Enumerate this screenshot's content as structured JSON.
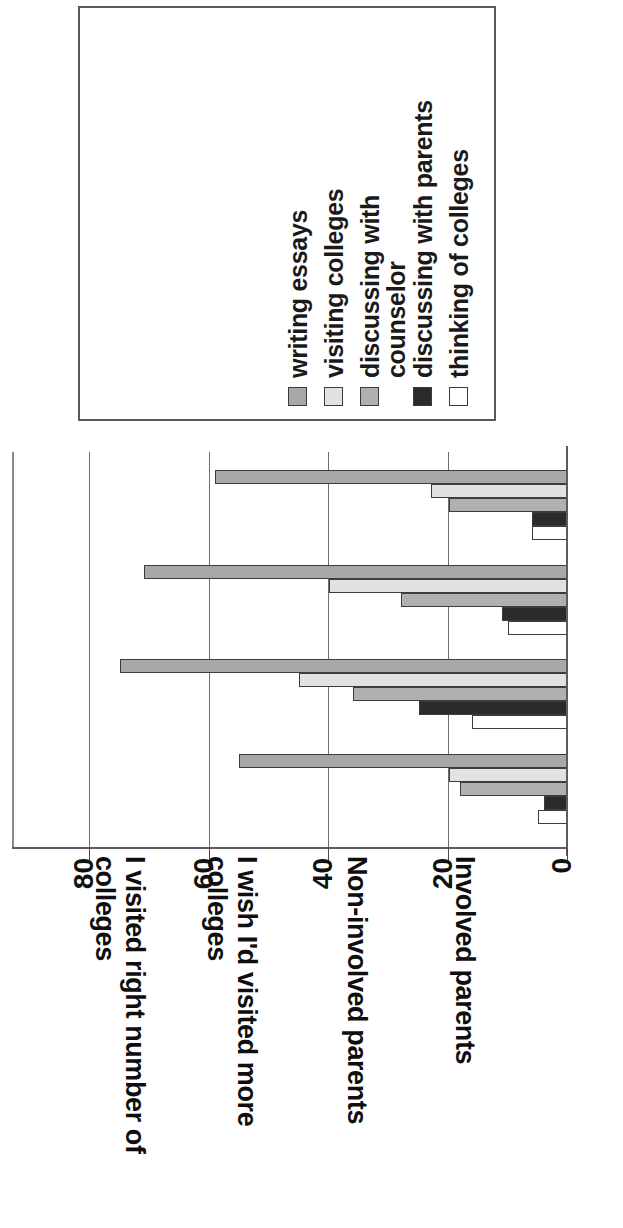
{
  "legend": {
    "items": [
      {
        "label": "writing essays",
        "color": "#a8a8a8",
        "swatch": "medium-gray"
      },
      {
        "label": "visiting colleges",
        "color": "#e2e2e2",
        "swatch": "light-gray"
      },
      {
        "label": "discussing with\ncounselor",
        "color": "#b0b0b0",
        "swatch": "medium-gray"
      },
      {
        "label": "discussing with parents",
        "color": "#2b2b2b",
        "swatch": "black"
      },
      {
        "label": "thinking of colleges",
        "color": "#ffffff",
        "swatch": "white"
      }
    ]
  },
  "axis": {
    "tick_labels": [
      "0",
      "20",
      "40",
      "60",
      "80"
    ],
    "ticks": [
      0,
      20,
      40,
      60,
      80
    ],
    "min": 0,
    "max": 80
  },
  "categories": [
    "I visited right number of\ncolleges",
    "I wish I'd visited more\ncolleges",
    "Non-involved parents",
    "Involved parents"
  ],
  "chart_data": {
    "type": "bar",
    "title": "",
    "subtitle": "",
    "orientation": "rotated-90-vertical-bars",
    "xlabel": "",
    "ylabel": "",
    "ylim": [
      0,
      80
    ],
    "grid": true,
    "legend_position": "top",
    "categories": [
      "I visited right number of colleges",
      "I wish I'd visited more colleges",
      "Non-involved parents",
      "Involved parents"
    ],
    "series": [
      {
        "name": "writing essays",
        "color": "#a8a8a8",
        "values": [
          59,
          71,
          75,
          55
        ]
      },
      {
        "name": "visiting colleges",
        "color": "#e2e2e2",
        "values": [
          23,
          40,
          45,
          20
        ]
      },
      {
        "name": "discussing with counselor",
        "color": "#b0b0b0",
        "values": [
          20,
          28,
          36,
          18
        ]
      },
      {
        "name": "discussing with parents",
        "color": "#2b2b2b",
        "values": [
          6,
          11,
          25,
          4
        ]
      },
      {
        "name": "thinking of colleges",
        "color": "#ffffff",
        "values": [
          6,
          10,
          16,
          5
        ]
      }
    ]
  }
}
